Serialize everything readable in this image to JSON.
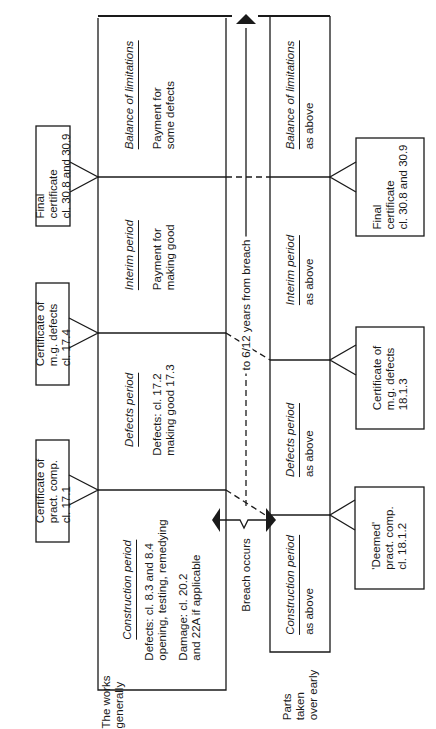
{
  "diagram": {
    "orientation": "rotated 90 degrees counter-clockwise; timeline runs bottom to top",
    "rows": {
      "works": {
        "label": "The works generally",
        "label_lines": [
          "The works",
          "generally"
        ],
        "periods": [
          {
            "title": "Construction period",
            "lines": [
              "Defects: cl. 8.3 and 8.4",
              "opening, testing, remedying"
            ],
            "lines2": [
              "Damage: cl. 20.2",
              "and 22A if applicable"
            ]
          },
          {
            "title": "Defects period",
            "lines": [
              "Defects: cl. 17.2",
              "making good 17.3"
            ]
          },
          {
            "title": "Interim period",
            "lines": [
              "Payment for",
              "making good"
            ]
          },
          {
            "title": "Balance of limitations",
            "lines": [
              "Payment for",
              "some defects"
            ]
          }
        ],
        "certificates": [
          {
            "lines": [
              "Certificate of",
              "pract. comp.",
              "cl. 17.1"
            ]
          },
          {
            "lines": [
              "Certificate of",
              "m.g. defects",
              "cl. 17.4"
            ]
          },
          {
            "lines": [
              "Final",
              "certificate",
              "cl. 30.8 and 30.9"
            ]
          }
        ]
      },
      "parts": {
        "label": "Parts taken over early",
        "label_lines": [
          "Parts",
          "taken",
          "over early"
        ],
        "periods": [
          {
            "title": "Construction period",
            "lines": [
              "as above"
            ]
          },
          {
            "title": "Defects period",
            "lines": [
              "as above"
            ]
          },
          {
            "title": "Interim period",
            "lines": [
              "as above"
            ]
          },
          {
            "title": "Balance of limitations",
            "lines": [
              "as above"
            ]
          }
        ],
        "certificates": [
          {
            "lines": [
              "'Deemed'",
              "pract. comp.",
              "cl. 18.1.2"
            ]
          },
          {
            "lines": [
              "Certificate of",
              "m.g. defects",
              "18.1.3"
            ]
          },
          {
            "lines": [
              "Final",
              "certificate",
              "cl. 30.8 and 30.9"
            ]
          }
        ]
      }
    },
    "annotations": {
      "breach": "Breach occurs",
      "limitation": "to 6/12 years from breach"
    },
    "colors": {
      "ink": "#1a1a1a",
      "background": "#ffffff"
    }
  }
}
